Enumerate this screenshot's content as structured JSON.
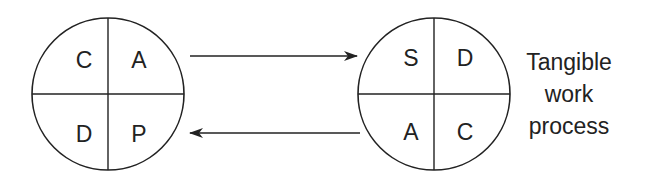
{
  "diagram": {
    "left_cycle": {
      "name": "CAPD",
      "quadrants": {
        "top_left": "C",
        "top_right": "A",
        "bottom_left": "D",
        "bottom_right": "P"
      }
    },
    "right_cycle": {
      "name": "SDCA",
      "quadrants": {
        "top_left": "S",
        "top_right": "D",
        "bottom_left": "A",
        "bottom_right": "C"
      }
    },
    "arrows": [
      {
        "from": "left_cycle",
        "to": "right_cycle",
        "position": "top"
      },
      {
        "from": "right_cycle",
        "to": "left_cycle",
        "position": "bottom"
      }
    ],
    "side_label": {
      "line1": "Tangible",
      "line2": "work",
      "line3": "process"
    },
    "colors": {
      "stroke": "#222222",
      "background": "#ffffff"
    }
  }
}
